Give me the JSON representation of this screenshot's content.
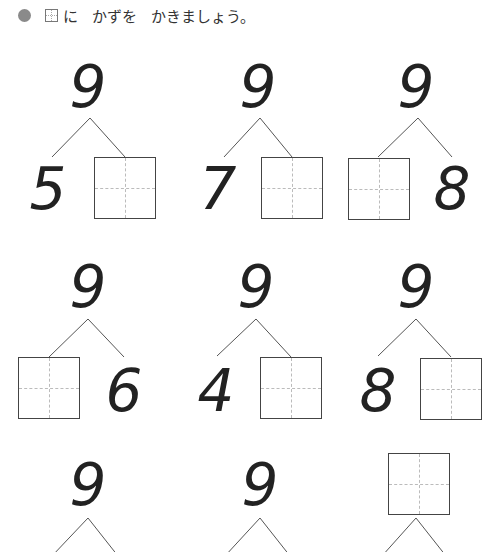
{
  "instruction": {
    "bullet": "circle-bullet",
    "box_label": "box-icon",
    "text_1": "に",
    "text_2": "かずを",
    "text_3": "かきましょう。"
  },
  "problems": [
    {
      "total": "9",
      "left": "5",
      "right": ""
    },
    {
      "total": "9",
      "left": "7",
      "right": ""
    },
    {
      "total": "9",
      "left": "",
      "right": "8"
    },
    {
      "total": "9",
      "left": "",
      "right": "6"
    },
    {
      "total": "9",
      "left": "4",
      "right": ""
    },
    {
      "total": "9",
      "left": "8",
      "right": ""
    },
    {
      "total": "9",
      "left": "",
      "right": ""
    },
    {
      "total": "9",
      "left": "",
      "right": ""
    },
    {
      "total": "",
      "left": "",
      "right": ""
    }
  ]
}
